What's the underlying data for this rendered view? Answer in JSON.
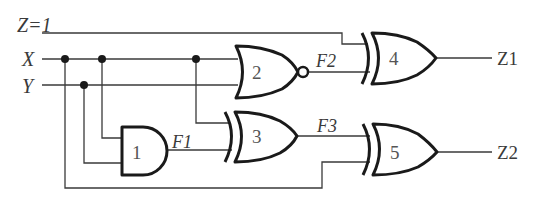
{
  "diagram": {
    "type": "logic-circuit",
    "inputs": [
      {
        "id": "Z",
        "label": "Z=1"
      },
      {
        "id": "X",
        "label": "X"
      },
      {
        "id": "Y",
        "label": "Y"
      }
    ],
    "gates": [
      {
        "id": "1",
        "label": "1",
        "type": "AND",
        "inputs": [
          "X",
          "Y"
        ],
        "output": "F1"
      },
      {
        "id": "2",
        "label": "2",
        "type": "NOR",
        "inputs": [
          "X",
          "Y"
        ],
        "output": "F2"
      },
      {
        "id": "3",
        "label": "3",
        "type": "XOR",
        "inputs": [
          "X",
          "F1"
        ],
        "output": "F3"
      },
      {
        "id": "4",
        "label": "4",
        "type": "XOR",
        "inputs": [
          "Z",
          "F2"
        ],
        "output": "Z1"
      },
      {
        "id": "5",
        "label": "5",
        "type": "XOR",
        "inputs": [
          "F3",
          "X"
        ],
        "output": "Z2"
      }
    ],
    "signals": [
      {
        "id": "F1",
        "label": "F1"
      },
      {
        "id": "F2",
        "label": "F2"
      },
      {
        "id": "F3",
        "label": "F3"
      }
    ],
    "outputs": [
      {
        "id": "Z1",
        "label": "Z1"
      },
      {
        "id": "Z2",
        "label": "Z2"
      }
    ],
    "colors": {
      "ink": "#1a1a1a",
      "wire": "#3a3a3a",
      "background": "#ffffff"
    }
  }
}
